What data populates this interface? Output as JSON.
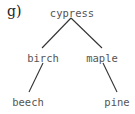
{
  "panel_label": "g)",
  "tree": {
    "root": "cypress",
    "nodes": {
      "cypress": {
        "label": "cypress",
        "x": 72,
        "y": 7
      },
      "birch": {
        "label": "birch",
        "x": 43,
        "y": 52
      },
      "maple": {
        "label": "maple",
        "x": 102,
        "y": 52
      },
      "beech": {
        "label": "beech",
        "x": 28,
        "y": 96
      },
      "pine": {
        "label": "pine",
        "x": 117,
        "y": 96
      }
    },
    "edges": [
      {
        "from": "cypress",
        "to": "birch"
      },
      {
        "from": "cypress",
        "to": "maple"
      },
      {
        "from": "birch",
        "to": "beech"
      },
      {
        "from": "maple",
        "to": "pine"
      }
    ]
  },
  "colors": {
    "edge": "#333333",
    "text": "#555555"
  }
}
